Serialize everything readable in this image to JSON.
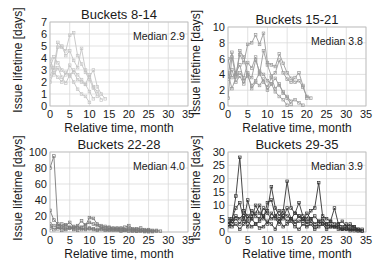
{
  "chart_data": [
    {
      "type": "line",
      "title": "Buckets 8-14",
      "xlabel": "Relative time, month",
      "ylabel": "Issue lifetime [days]",
      "annotation": "Median 2.9",
      "xlim": [
        0,
        35
      ],
      "ylim": [
        0,
        7
      ],
      "xticks": [
        0,
        5,
        10,
        15,
        20,
        25,
        30,
        35
      ],
      "yticks": [
        0,
        1,
        2,
        3,
        4,
        5,
        6,
        7
      ],
      "grid": true,
      "color": "#c4c4c4",
      "box": {
        "x0": 50,
        "x1": 188,
        "y0": 106,
        "y1": 22
      },
      "series": [
        {
          "x": [
            0,
            1,
            2,
            3,
            4,
            5,
            6,
            7,
            8,
            9,
            10,
            11,
            12
          ],
          "y": [
            2.5,
            3.2,
            5.3,
            4.9,
            4.6,
            5.9,
            6.1,
            4.2,
            3.5,
            2.8,
            2.2,
            1.5,
            0.8
          ]
        },
        {
          "x": [
            0,
            1,
            2,
            3,
            4,
            5,
            6,
            7,
            8,
            9,
            10,
            11,
            12,
            13,
            14
          ],
          "y": [
            3.9,
            3.0,
            4.9,
            5.0,
            4.2,
            4.6,
            3.8,
            3.2,
            4.8,
            3.0,
            2.4,
            3.0,
            1.6,
            1.0,
            0.6
          ]
        },
        {
          "x": [
            0,
            1,
            2,
            3,
            4,
            5,
            6,
            7,
            8,
            9,
            10,
            11
          ],
          "y": [
            3.2,
            4.1,
            3.6,
            3.0,
            2.6,
            3.4,
            2.8,
            2.2,
            2.0,
            1.8,
            1.2,
            0.6
          ]
        },
        {
          "x": [
            0,
            1,
            2,
            3,
            4,
            5,
            6,
            7,
            8,
            9,
            10,
            11,
            12,
            13
          ],
          "y": [
            2.0,
            2.8,
            2.4,
            2.0,
            2.8,
            2.5,
            3.0,
            2.6,
            2.2,
            1.8,
            2.6,
            1.6,
            1.2,
            0.5
          ]
        },
        {
          "x": [
            0,
            1,
            2,
            3,
            4,
            5,
            6,
            7,
            8,
            9,
            10
          ],
          "y": [
            3.5,
            2.6,
            3.2,
            2.4,
            1.9,
            2.6,
            2.0,
            1.4,
            1.0,
            0.8,
            0.3
          ]
        }
      ]
    },
    {
      "type": "line",
      "title": "Buckets 15-21",
      "xlabel": "Relative time, month",
      "ylabel": "Issue lifetime [days]",
      "annotation": "Median 3.8",
      "xlim": [
        0,
        35
      ],
      "ylim": [
        0,
        10
      ],
      "xticks": [
        0,
        5,
        10,
        15,
        20,
        25,
        30,
        35
      ],
      "yticks": [
        0,
        2,
        4,
        6,
        8,
        10
      ],
      "grid": true,
      "color": "#9a9a9a",
      "box": {
        "x0": 228,
        "x1": 366,
        "y0": 106,
        "y1": 27
      },
      "series": [
        {
          "x": [
            0,
            1,
            2,
            3,
            4,
            5,
            6,
            7,
            8,
            9,
            10,
            11,
            12,
            13,
            14,
            15,
            16,
            17,
            18,
            19,
            20,
            21
          ],
          "y": [
            3.8,
            6.8,
            4.0,
            6.5,
            5.5,
            7.8,
            8.0,
            9.0,
            7.8,
            9.2,
            5.5,
            5.2,
            5.0,
            6.6,
            5.4,
            4.2,
            3.5,
            3.0,
            3.2,
            2.4,
            1.2,
            1.0
          ]
        },
        {
          "x": [
            0,
            1,
            2,
            3,
            4,
            5,
            6,
            7,
            8,
            9,
            10,
            11,
            12,
            13,
            14,
            15,
            16,
            17,
            18,
            19,
            20
          ],
          "y": [
            1.0,
            6.2,
            3.8,
            4.2,
            3.6,
            5.5,
            4.8,
            6.2,
            4.0,
            7.0,
            5.2,
            3.8,
            4.2,
            5.8,
            4.2,
            3.4,
            3.0,
            3.6,
            4.2,
            2.6,
            1.0
          ]
        },
        {
          "x": [
            0,
            1,
            2,
            3,
            4,
            5,
            6,
            7,
            8,
            9,
            10,
            11,
            12,
            13,
            14,
            15,
            16
          ],
          "y": [
            4.2,
            2.2,
            3.6,
            7.0,
            6.2,
            4.0,
            3.6,
            5.8,
            4.4,
            4.0,
            3.2,
            2.8,
            3.5,
            2.6,
            1.8,
            1.0,
            0.2
          ]
        },
        {
          "x": [
            0,
            1,
            2,
            3,
            4,
            5,
            6,
            7,
            8,
            9,
            10,
            11,
            12,
            13,
            14,
            15
          ],
          "y": [
            3.4,
            4.6,
            3.0,
            3.8,
            2.8,
            4.2,
            2.2,
            3.0,
            2.6,
            3.4,
            2.0,
            2.8,
            1.8,
            1.2,
            0.8,
            0.1
          ]
        },
        {
          "x": [
            0,
            1,
            2,
            3,
            4,
            5,
            6,
            7,
            8,
            9,
            10,
            11,
            12,
            13,
            14,
            15,
            16,
            17,
            18,
            19
          ],
          "y": [
            6.0,
            3.6,
            4.2,
            5.2,
            3.2,
            3.8,
            2.6,
            3.2,
            4.2,
            3.0,
            2.4,
            3.6,
            2.2,
            2.8,
            1.6,
            1.2,
            0.6,
            0.8,
            0.4,
            0.1
          ]
        }
      ]
    },
    {
      "type": "line",
      "title": "Buckets 22-28",
      "xlabel": "Relative time, month",
      "ylabel": "Issue lifetime [days]",
      "annotation": "Median 4.0",
      "xlim": [
        0,
        35
      ],
      "ylim": [
        0,
        100
      ],
      "xticks": [
        0,
        5,
        10,
        15,
        20,
        25,
        30,
        35
      ],
      "yticks": [
        0,
        20,
        40,
        60,
        80,
        100
      ],
      "grid": true,
      "color": "#7a7a7a",
      "box": {
        "x0": 50,
        "x1": 188,
        "y0": 232,
        "y1": 152
      },
      "series": [
        {
          "x": [
            0,
            1,
            2,
            3,
            4,
            5,
            6,
            7,
            8,
            9,
            10,
            11,
            12,
            13,
            14,
            15,
            16,
            17,
            18,
            19,
            20,
            21,
            22,
            23,
            24,
            25,
            26,
            27,
            28
          ],
          "y": [
            80,
            95,
            8,
            10,
            8,
            12,
            6,
            8,
            14,
            8,
            18,
            17,
            10,
            8,
            7,
            6,
            5,
            5,
            4,
            6,
            8,
            4,
            4,
            5,
            3,
            3,
            2,
            2,
            1
          ]
        },
        {
          "x": [
            0,
            1,
            2,
            3,
            4,
            5,
            6,
            7,
            8,
            9,
            10,
            11,
            12,
            13,
            14,
            15,
            16,
            17,
            18,
            19,
            20,
            21,
            22,
            23,
            24,
            25,
            26,
            27
          ],
          "y": [
            27,
            15,
            10,
            6,
            9,
            5,
            7,
            5,
            6,
            9,
            12,
            10,
            8,
            6,
            5,
            5,
            4,
            4,
            5,
            3,
            4,
            3,
            3,
            2,
            2,
            2,
            1,
            1
          ]
        },
        {
          "x": [
            0,
            1,
            2,
            3,
            4,
            5,
            6,
            7,
            8,
            9,
            10,
            11,
            12,
            13,
            14,
            15,
            16,
            17,
            18,
            19,
            20,
            21,
            22,
            23,
            24,
            25,
            26
          ],
          "y": [
            5,
            8,
            4,
            6,
            3,
            5,
            4,
            6,
            3,
            4,
            5,
            4,
            3,
            4,
            3,
            3,
            2,
            3,
            2,
            2,
            3,
            2,
            1,
            2,
            1,
            1,
            0.5
          ]
        },
        {
          "x": [
            0,
            1,
            2,
            3,
            4,
            5,
            6,
            7,
            8,
            9,
            10,
            11,
            12,
            13,
            14,
            15,
            16,
            17,
            18,
            19,
            20,
            21,
            22,
            23,
            24,
            25
          ],
          "y": [
            10,
            3,
            6,
            2,
            4,
            6,
            3,
            2,
            5,
            3,
            4,
            3,
            2,
            3,
            2,
            2,
            3,
            2,
            1,
            2,
            1,
            1,
            1,
            1,
            0.5,
            0.3
          ]
        }
      ]
    },
    {
      "type": "line",
      "title": "Buckets 29-35",
      "xlabel": "Relative time, month",
      "ylabel": "Issue lifetime [days]",
      "annotation": "Median 3.9",
      "xlim": [
        0,
        35
      ],
      "ylim": [
        0,
        30
      ],
      "xticks": [
        0,
        5,
        10,
        15,
        20,
        25,
        30,
        35
      ],
      "yticks": [
        0,
        5,
        10,
        15,
        20,
        25,
        30
      ],
      "grid": true,
      "color": "#333333",
      "box": {
        "x0": 228,
        "x1": 366,
        "y0": 232,
        "y1": 152
      },
      "series": [
        {
          "x": [
            0,
            1,
            2,
            3,
            4,
            5,
            6,
            7,
            8,
            9,
            10,
            11,
            12,
            13,
            14,
            15,
            16,
            17,
            18,
            19,
            20,
            21,
            22,
            23,
            24,
            25,
            26,
            27,
            28,
            29,
            30,
            31,
            32,
            33,
            34
          ],
          "y": [
            5,
            4,
            13.5,
            28,
            8,
            6,
            5,
            10,
            7,
            6,
            8,
            17,
            9,
            6,
            8,
            19,
            9,
            7,
            11,
            6,
            5,
            8,
            9,
            18.5,
            6,
            5,
            4,
            9,
            3,
            4,
            2,
            3,
            2,
            1,
            1
          ]
        },
        {
          "x": [
            0,
            1,
            2,
            3,
            4,
            5,
            6,
            7,
            8,
            9,
            10,
            11,
            12,
            13,
            14,
            15,
            16,
            17,
            18,
            19,
            20,
            21,
            22,
            23,
            24,
            25,
            26,
            27,
            28,
            29,
            30,
            31,
            32,
            33,
            34
          ],
          "y": [
            3,
            5,
            9,
            11,
            4,
            12,
            6,
            7,
            10,
            5,
            11,
            12,
            6,
            8,
            5,
            9,
            5,
            7,
            6,
            4,
            7,
            5,
            6,
            4,
            5,
            3,
            4,
            3,
            3,
            2,
            3,
            2,
            2,
            1,
            0.5
          ]
        },
        {
          "x": [
            0,
            1,
            2,
            3,
            4,
            5,
            6,
            7,
            8,
            9,
            10,
            11,
            12,
            13,
            14,
            15,
            16,
            17,
            18,
            19,
            20,
            21,
            22,
            23,
            24,
            25,
            26,
            27,
            28,
            29,
            30,
            31,
            32,
            33
          ],
          "y": [
            2,
            3,
            5,
            3,
            6,
            2,
            5,
            3,
            4,
            6,
            3,
            7,
            5,
            3,
            6,
            4,
            5,
            3,
            4,
            5,
            3,
            4,
            2,
            3,
            4,
            2,
            3,
            2,
            2,
            1,
            2,
            1,
            1,
            0.5
          ]
        },
        {
          "x": [
            0,
            1,
            2,
            3,
            4,
            5,
            6,
            7,
            8,
            9,
            10,
            11,
            12,
            13,
            14,
            15,
            16,
            17,
            18,
            19,
            20,
            21,
            22,
            23,
            24,
            25,
            26,
            27,
            28,
            29,
            30,
            31,
            32,
            33,
            34
          ],
          "y": [
            4,
            2,
            3,
            1,
            3,
            4,
            2,
            3,
            1.5,
            2,
            4,
            3,
            1,
            5,
            2,
            3,
            4,
            2,
            1,
            3,
            2,
            3,
            1,
            2,
            3,
            1,
            2,
            2,
            1,
            1,
            1,
            0.5,
            1,
            0.5,
            0.3
          ]
        },
        {
          "x": [
            0,
            1,
            2,
            3,
            4,
            5,
            6,
            7,
            8,
            9,
            10,
            11,
            12,
            13,
            14,
            15,
            16,
            17,
            18,
            19,
            20,
            21,
            22,
            23,
            24,
            25,
            26,
            27,
            28,
            29,
            30,
            31,
            32
          ],
          "y": [
            3,
            4,
            6,
            5,
            7,
            5,
            8,
            6,
            5,
            9,
            7,
            5,
            6,
            4,
            7,
            6,
            5,
            4,
            6,
            5,
            4,
            5,
            3,
            4,
            3,
            3,
            2,
            2,
            2,
            1,
            1,
            1,
            0.5
          ]
        }
      ]
    }
  ]
}
